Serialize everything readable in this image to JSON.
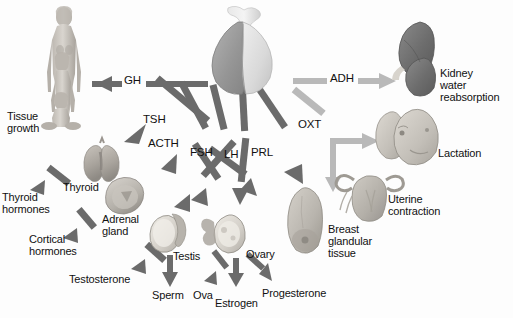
{
  "figure": {
    "background_color": "#fdfdfd",
    "source_gland": "pituitary gland"
  },
  "palette": {
    "anterior_arrow": "#6b6b6b",
    "posterior_arrow": "#b9b9b9",
    "anterior_lobe": "#9c9c9c",
    "posterior_lobe": "#d6d6d6",
    "kidney": "#6f6f6f",
    "tissue": "#b0aca6",
    "text": "#111111"
  },
  "hormones": [
    {
      "abbr": "GH",
      "lobe": "anterior",
      "target": "Tissue growth"
    },
    {
      "abbr": "TSH",
      "lobe": "anterior",
      "target": "Thyroid"
    },
    {
      "abbr": "ACTH",
      "lobe": "anterior",
      "target": "Adrenal gland"
    },
    {
      "abbr": "FSH",
      "lobe": "anterior",
      "target": "Testis / Ovary"
    },
    {
      "abbr": "LH",
      "lobe": "anterior",
      "target": "Testis / Ovary"
    },
    {
      "abbr": "PRL",
      "lobe": "anterior",
      "target": "Breast glandular tissue"
    },
    {
      "abbr": "ADH",
      "lobe": "posterior",
      "target": "Kidney water reabsorption"
    },
    {
      "abbr": "OXT",
      "lobe": "posterior",
      "target": "Lactation / Uterine contraction"
    }
  ],
  "labels": {
    "gh": "GH",
    "tsh": "TSH",
    "acth": "ACTH",
    "fsh": "FSH",
    "lh": "LH",
    "prl": "PRL",
    "adh": "ADH",
    "oxt": "OXT",
    "tissue_growth": "Tissue\ngrowth",
    "thyroid": "Thyroid",
    "thyroid_hormones": "Thyroid\nhormones",
    "adrenal_gland": "Adrenal\ngland",
    "cortical_hormones": "Cortical\nhormones",
    "testis": "Testis",
    "testosterone": "Testosterone",
    "sperm": "Sperm",
    "ovary": "Ovary",
    "ova": "Ova",
    "estrogen": "Estrogen",
    "progesterone": "Progesterone",
    "breast_glandular_tissue": "Breast\nglandular\ntissue",
    "kidney_water_reabsorption": "Kidney\nwater\nreabsorption",
    "lactation": "Lactation",
    "uterine_contraction": "Uterine\ncontraction"
  },
  "organs": [
    {
      "name": "growth-figures",
      "description": "three human figures of increasing size"
    },
    {
      "name": "thyroid-gland",
      "description": "butterfly-shaped thyroid gland"
    },
    {
      "name": "adrenal-gland",
      "description": "adrenal gland cross-section"
    },
    {
      "name": "testis",
      "description": "testis with epididymis"
    },
    {
      "name": "ovary",
      "description": "ovary with follicles"
    },
    {
      "name": "breast",
      "description": "breast glandular tissue"
    },
    {
      "name": "kidney",
      "description": "kidney"
    },
    {
      "name": "nursing-infant",
      "description": "infant nursing at breast"
    },
    {
      "name": "uterus",
      "description": "uterus with fallopian tubes"
    }
  ]
}
